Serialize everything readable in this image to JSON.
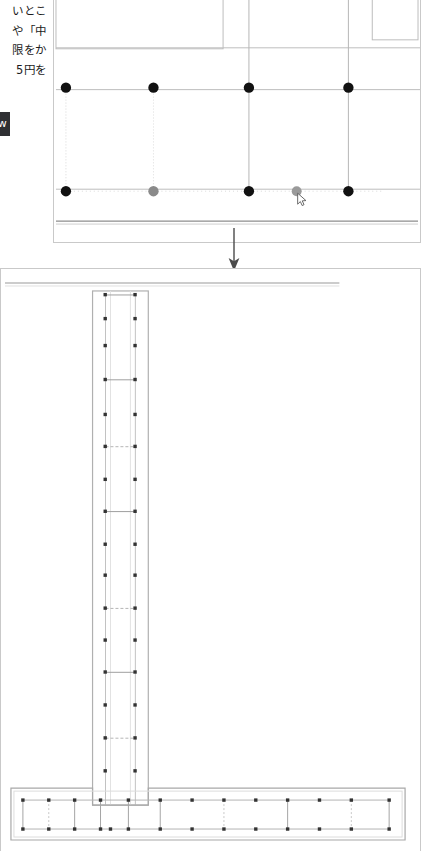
{
  "document": {
    "app_kind": "cad-drawing-viewer",
    "file_format_badge": "jww",
    "background_color": "#ffffff",
    "line_color": "#b9b9b9",
    "heavy_line_color": "#8d8d8d",
    "node_color": "#111111",
    "node_highlight_color": "#8a8a8a"
  },
  "article_text": {
    "lines": [
      "いとこ",
      "や「中",
      "限をか",
      "5円を"
    ]
  },
  "panel_top": {
    "name": "plan-view",
    "caption": "",
    "columns_x": [
      12,
      100,
      196,
      296,
      368
    ],
    "rows_y": [
      30,
      90,
      190,
      222
    ],
    "nodes": [
      {
        "x": 12,
        "y": 88,
        "state": "normal"
      },
      {
        "x": 100,
        "y": 88,
        "state": "normal"
      },
      {
        "x": 196,
        "y": 88,
        "state": "normal"
      },
      {
        "x": 296,
        "y": 88,
        "state": "normal"
      },
      {
        "x": 12,
        "y": 192,
        "state": "normal"
      },
      {
        "x": 100,
        "y": 192,
        "state": "highlight"
      },
      {
        "x": 196,
        "y": 192,
        "state": "normal"
      },
      {
        "x": 244,
        "y": 192,
        "state": "highlight"
      },
      {
        "x": 296,
        "y": 192,
        "state": "normal"
      }
    ],
    "cursor": {
      "x": 248,
      "y": 196,
      "visible": true
    }
  },
  "panel_bottom": {
    "name": "elevation-view",
    "column": {
      "outline_x": 92,
      "outline_y": 22,
      "outline_w": 56,
      "outline_h": 515,
      "rebar_left_x": 105,
      "rebar_right_x": 135,
      "stirrup_y": [
        26,
        50,
        77,
        111,
        146,
        178,
        211,
        243,
        276,
        307,
        340,
        372,
        404,
        437,
        470,
        503
      ],
      "stirrup_style": [
        "solid",
        "none",
        "none",
        "solid",
        "none",
        "dashed",
        "none",
        "solid",
        "none",
        "none",
        "dashed",
        "none",
        "solid",
        "none",
        "none",
        "none"
      ]
    },
    "footing": {
      "outline_x": 10,
      "outline_y": 520,
      "outline_w": 396,
      "outline_h": 52,
      "rebar_top_y": 532,
      "rebar_bottom_y": 561,
      "vertex_x": [
        22,
        48,
        74,
        100,
        110,
        128,
        160,
        192,
        224,
        256,
        288,
        320,
        352,
        384
      ],
      "stirrup_style": [
        "solid",
        "dashed",
        "solid",
        "solid",
        "none",
        "solid",
        "none",
        "solid",
        "dashed",
        "none",
        "solid",
        "solid",
        "dashed",
        "solid"
      ]
    }
  },
  "connector": {
    "name": "flow-arrow",
    "direction": "down"
  }
}
